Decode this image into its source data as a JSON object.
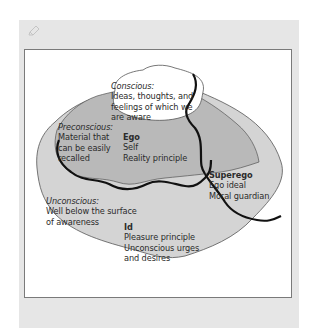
{
  "diagram": {
    "colors": {
      "conscious_fill": "#ffffff",
      "preconscious_fill": "#b9b9b9",
      "unconscious_fill": "#d4d4d4",
      "divider_line": "#111111",
      "card_bg": "#e6e6e6"
    },
    "conscious": {
      "title": "Conscious:",
      "lines": [
        "Ideas, thoughts, and",
        "feelings of which we",
        "are aware"
      ]
    },
    "preconscious": {
      "title": "Preconscious:",
      "lines": [
        "Material that",
        "can be easily",
        "recalled"
      ]
    },
    "ego": {
      "title": "Ego",
      "lines": [
        "Self",
        "Reality principle"
      ]
    },
    "superego": {
      "title": "Superego",
      "lines": [
        "Ego ideal",
        "Moral guardian"
      ]
    },
    "unconscious": {
      "title": "Unconscious:",
      "lines": [
        "Well below the surface",
        "of awareness"
      ]
    },
    "id": {
      "title": "Id",
      "lines": [
        "Pleasure principle",
        "Unconscious urges",
        "and desires"
      ]
    }
  },
  "toolbar": {
    "icon": "edit-icon"
  }
}
